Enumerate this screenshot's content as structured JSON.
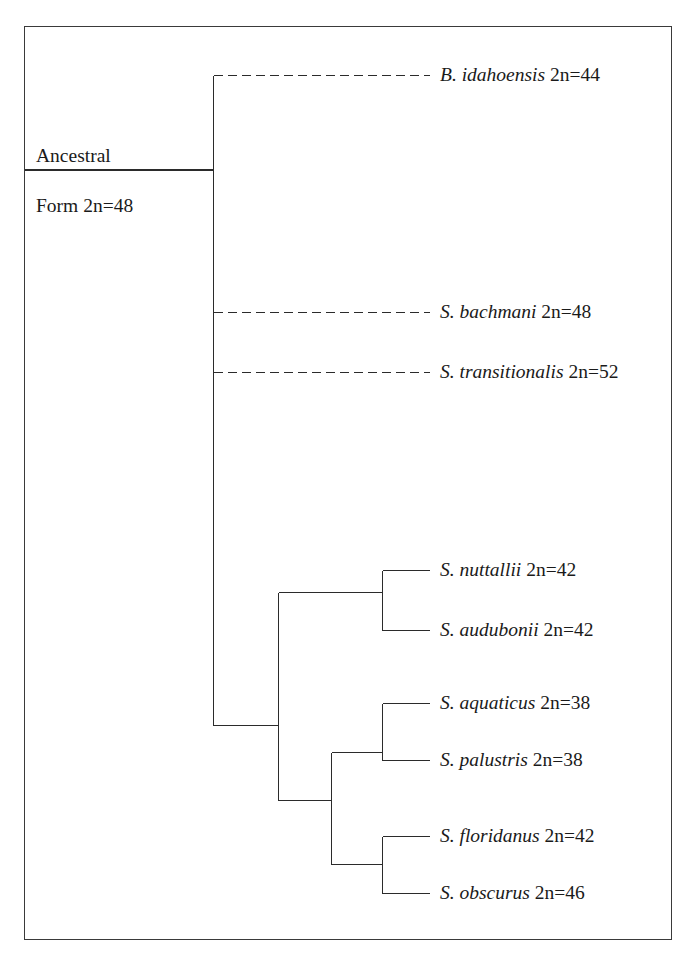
{
  "figure": {
    "type": "cladogram",
    "background_color": "#ffffff",
    "line_color": "#2b2b2b",
    "border_color": "#3a3a3a"
  },
  "root": {
    "label_line1": "Ancestral",
    "label_line2": "Form 2n=48"
  },
  "taxa": [
    {
      "id": "b-idahoensis",
      "name": "B. idahoensis",
      "chromosomes": "2n=44",
      "branch_style": "dashed"
    },
    {
      "id": "s-bachmani",
      "name": "S. bachmani",
      "chromosomes": "2n=48",
      "branch_style": "dashed"
    },
    {
      "id": "s-transitionalis",
      "name": "S. transitionalis",
      "chromosomes": "2n=52",
      "branch_style": "dashed"
    },
    {
      "id": "s-nuttallii",
      "name": "S. nuttallii",
      "chromosomes": "2n=42",
      "branch_style": "solid"
    },
    {
      "id": "s-audubonii",
      "name": "S. audubonii",
      "chromosomes": "2n=42",
      "branch_style": "solid"
    },
    {
      "id": "s-aquaticus",
      "name": "S. aquaticus",
      "chromosomes": "2n=38",
      "branch_style": "solid"
    },
    {
      "id": "s-palustris",
      "name": "S. palustris",
      "chromosomes": "2n=38",
      "branch_style": "solid"
    },
    {
      "id": "s-floridanus",
      "name": "S. floridanus",
      "chromosomes": "2n=42",
      "branch_style": "solid"
    },
    {
      "id": "s-obscurus",
      "name": "S. obscurus",
      "chromosomes": "2n=46",
      "branch_style": "solid"
    }
  ]
}
